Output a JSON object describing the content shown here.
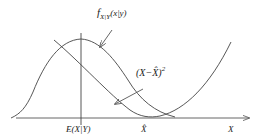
{
  "diagram": {
    "title": "",
    "labels": {
      "density": "f",
      "density_sub": "X|Y",
      "density_arg": "(x|y)",
      "loss": "(X−X̂)",
      "loss_exp": "2",
      "conditional_mean": "E(X|Y)",
      "estimate": "X̂",
      "axis": "X"
    },
    "colors": {
      "stroke": "#444444",
      "text": "#222222",
      "background": "#ffffff"
    }
  }
}
